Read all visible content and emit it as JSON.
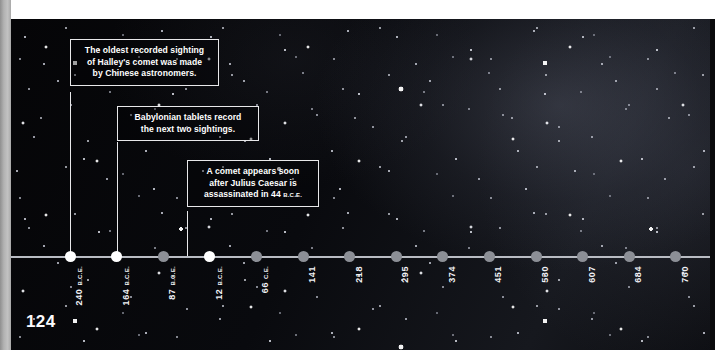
{
  "page": {
    "number": "124",
    "background_color": "#07070a",
    "accent_color": "#ffffff",
    "dot_color": "#8c8f96",
    "dot_highlight_color": "#ffffff",
    "axis_color": "#b9bcc3"
  },
  "callouts": [
    {
      "id": "oldest-sighting",
      "lines": [
        "The oldest recorded sighting",
        "of Halley's comet was made",
        "by Chinese astronomers."
      ],
      "era_suffix": "",
      "target_year_label": "240 B.C.E."
    },
    {
      "id": "babylonian-tablets",
      "lines": [
        "Babylonian tablets record",
        "the next two sightings."
      ],
      "era_suffix": "",
      "target_year_label": "164 B.C.E."
    },
    {
      "id": "julius-caesar",
      "lines": [
        "A comet appears soon",
        "after Julius Caesar is",
        "assassinated in 44"
      ],
      "era_suffix": "B.C.E.",
      "target_year_label": "12 B.C.E."
    }
  ],
  "timeline": {
    "ticks": [
      {
        "year": "240",
        "era": "B.C.E.",
        "highlight": true
      },
      {
        "year": "164",
        "era": "B.C.E.",
        "highlight": true
      },
      {
        "year": "87",
        "era": "B.C.E.",
        "highlight": false
      },
      {
        "year": "12",
        "era": "B.C.E.",
        "highlight": true
      },
      {
        "year": "66",
        "era": "C.E.",
        "highlight": false
      },
      {
        "year": "141",
        "era": "",
        "highlight": false
      },
      {
        "year": "218",
        "era": "",
        "highlight": false
      },
      {
        "year": "295",
        "era": "",
        "highlight": false
      },
      {
        "year": "374",
        "era": "",
        "highlight": false
      },
      {
        "year": "451",
        "era": "",
        "highlight": false
      },
      {
        "year": "530",
        "era": "",
        "highlight": false
      },
      {
        "year": "607",
        "era": "",
        "highlight": false
      },
      {
        "year": "684",
        "era": "",
        "highlight": false
      },
      {
        "year": "760",
        "era": "",
        "highlight": false
      }
    ]
  }
}
